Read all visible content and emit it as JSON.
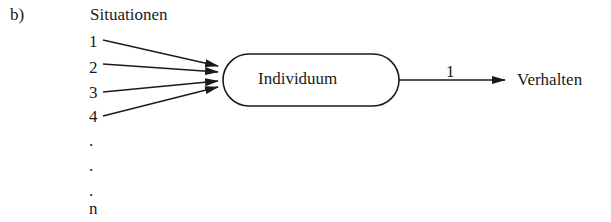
{
  "figure": {
    "label": "b)",
    "situations_title": "Situationen",
    "situations": [
      {
        "label": "1"
      },
      {
        "label": "2"
      },
      {
        "label": "3"
      },
      {
        "label": "4"
      },
      {
        "label": "."
      },
      {
        "label": "."
      },
      {
        "label": "."
      },
      {
        "label": "n"
      }
    ],
    "node": {
      "label": "Individuum"
    },
    "edge": {
      "label": "1"
    },
    "output": {
      "label": "Verhalten"
    },
    "colors": {
      "ink": "#1a1a1a",
      "background": "#ffffff"
    }
  }
}
